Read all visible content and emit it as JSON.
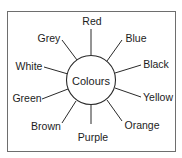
{
  "diagram": {
    "type": "spider-diagram",
    "center": {
      "label": "Colours",
      "x": 91,
      "y": 80,
      "r": 24.5
    },
    "colors": {
      "stroke": "#2a2a2a",
      "frame": "#6e6e6e",
      "text": "#1c1c1c",
      "background": "#ffffff"
    },
    "branches": [
      {
        "label": "Red",
        "lx": 92,
        "ly": 21,
        "x1": 91,
        "y1": 29,
        "x2": 91,
        "y2": 55.5
      },
      {
        "label": "Blue",
        "lx": 136,
        "ly": 38,
        "x1": 122,
        "y1": 40,
        "x2": 107,
        "y2": 61
      },
      {
        "label": "Black",
        "lx": 156,
        "ly": 64,
        "x1": 141,
        "y1": 65,
        "x2": 115,
        "y2": 73
      },
      {
        "label": "Yellow",
        "lx": 158,
        "ly": 97,
        "x1": 141,
        "y1": 97,
        "x2": 115,
        "y2": 88
      },
      {
        "label": "Orange",
        "lx": 142,
        "ly": 125,
        "x1": 122,
        "y1": 121,
        "x2": 107,
        "y2": 100
      },
      {
        "label": "Purple",
        "lx": 93,
        "ly": 137,
        "x1": 91,
        "y1": 124,
        "x2": 91,
        "y2": 104.5
      },
      {
        "label": "Brown",
        "lx": 46,
        "ly": 126,
        "x1": 62,
        "y1": 123,
        "x2": 76,
        "y2": 101
      },
      {
        "label": "Green",
        "lx": 27,
        "ly": 98,
        "x1": 42,
        "y1": 99,
        "x2": 68,
        "y2": 89
      },
      {
        "label": "White",
        "lx": 29,
        "ly": 66,
        "x1": 44,
        "y1": 67,
        "x2": 68,
        "y2": 74
      },
      {
        "label": "Grey",
        "lx": 49,
        "ly": 38,
        "x1": 62,
        "y1": 40,
        "x2": 77,
        "y2": 60
      }
    ]
  }
}
